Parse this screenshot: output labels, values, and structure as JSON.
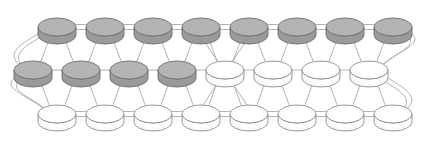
{
  "figure": {
    "kind": "node-link-graph-diagram",
    "background_color": "#FFFFFF",
    "width": 438,
    "height": 141,
    "title": ""
  },
  "style": {
    "node_fill_shaded": "#ABABAB",
    "node_fill_shaded_side": "#9A9A9A",
    "node_fill_shaded_top": "#B4B4B4",
    "node_fill_plain": "#FFFFFF",
    "node_fill_plain_side": "#FCFCFC",
    "node_stroke_shaded": "#6E6E6E",
    "node_stroke_plain": "#8C8C8C",
    "edge_color": "#9E9E9E",
    "edge_width": 0.8,
    "node_radius_x": 19,
    "node_radius_y": 9,
    "node_depth": 8
  },
  "legend": {
    "shaded_label": "shaded node",
    "plain_label": "unshaded node"
  },
  "rows": [
    {
      "id": "row-top",
      "name": "top-row",
      "y": 27,
      "x_start": 57,
      "x_step": 48,
      "count": 8,
      "nodes": [
        {
          "id": "t0",
          "label": "",
          "shaded": true
        },
        {
          "id": "t1",
          "label": "",
          "shaded": true
        },
        {
          "id": "t2",
          "label": "",
          "shaded": true
        },
        {
          "id": "t3",
          "label": "",
          "shaded": true
        },
        {
          "id": "t4",
          "label": "",
          "shaded": true
        },
        {
          "id": "t5",
          "label": "",
          "shaded": true
        },
        {
          "id": "t6",
          "label": "",
          "shaded": true
        },
        {
          "id": "t7",
          "label": "",
          "shaded": true
        }
      ]
    },
    {
      "id": "row-middle",
      "name": "middle-row",
      "y": 70,
      "x_start": 33,
      "x_step": 48,
      "count": 8,
      "nodes": [
        {
          "id": "m0",
          "label": "",
          "shaded": true
        },
        {
          "id": "m1",
          "label": "",
          "shaded": true
        },
        {
          "id": "m2",
          "label": "",
          "shaded": true
        },
        {
          "id": "m3",
          "label": "",
          "shaded": true
        },
        {
          "id": "m4",
          "label": "",
          "shaded": false
        },
        {
          "id": "m5",
          "label": "",
          "shaded": false
        },
        {
          "id": "m6",
          "label": "",
          "shaded": false
        },
        {
          "id": "m7",
          "label": "",
          "shaded": false
        }
      ]
    },
    {
      "id": "row-bottom",
      "name": "bottom-row",
      "y": 114,
      "x_start": 57,
      "x_step": 48,
      "count": 8,
      "nodes": [
        {
          "id": "b0",
          "label": "",
          "shaded": false
        },
        {
          "id": "b1",
          "label": "",
          "shaded": false
        },
        {
          "id": "b2",
          "label": "",
          "shaded": false
        },
        {
          "id": "b3",
          "label": "",
          "shaded": false
        },
        {
          "id": "b4",
          "label": "",
          "shaded": false
        },
        {
          "id": "b5",
          "label": "",
          "shaded": false
        },
        {
          "id": "b6",
          "label": "",
          "shaded": false
        },
        {
          "id": "b7",
          "label": "",
          "shaded": false
        }
      ]
    }
  ],
  "edges": {
    "horizontal_rows": [
      "row-top",
      "row-middle",
      "row-bottom"
    ],
    "middle_gap_after_index": 3,
    "middle_gap_has_crossing": true,
    "diagonals": [
      {
        "from": "row-top",
        "to": "row-middle"
      },
      {
        "from": "row-middle",
        "to": "row-bottom"
      }
    ],
    "wrap_left": true,
    "wrap_right": true
  },
  "counts": {
    "total_nodes": 24,
    "shaded_nodes": 12,
    "plain_nodes": 12,
    "rows": 3,
    "columns": 8
  }
}
